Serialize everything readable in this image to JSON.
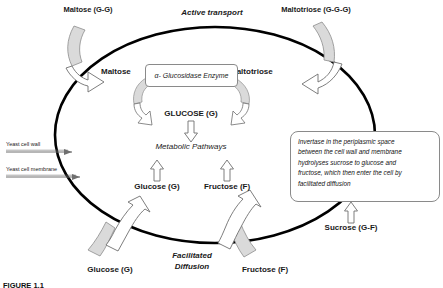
{
  "figure": {
    "caption": "FIGURE 1.1",
    "cell_outline_name": "yeast-cell-boundary"
  },
  "top_labels": {
    "maltose_extracellular": "Maltose (G-G)",
    "active_transport": "Active transport",
    "maltotriose_extracellular": "Maltotriose (G-G-G)"
  },
  "inside_labels": {
    "maltose": "Maltose",
    "maltotriose": "Maltotriose",
    "enzyme": "α- Glucosidase Enzyme",
    "glucose_pool": "GLUCOSE (G)",
    "metabolic_pathways": "Metabolic Pathways",
    "glucose": "Glucose (G)",
    "fructose": "Fructose (F)"
  },
  "left_labels": {
    "cell_wall": "Yeast cell wall",
    "cell_membrane": "Yeast cell membrane"
  },
  "bottom_labels": {
    "glucose_extracellular": "Glucose (G)",
    "facilitated_line1": "Facilitated",
    "facilitated_line2": "Diffusion",
    "fructose_extracellular": "Fructose (F)"
  },
  "right_panel": {
    "text": "Invertase in the periplasmic space between the cell wall and membrane hydrolyses  sucrose to glucose and fructose, which then enter the cell by facilitated diffusion",
    "lines": [
      "Invertase in the periplasmic space",
      "between the cell wall and membrane",
      "hydrolyses  sucrose to glucose and",
      "fructose, which then enter the cell by",
      "facilitated diffusion"
    ],
    "substrate": "Sucrose (G-F)"
  },
  "colors": {
    "outline": "#000000",
    "arrow_stroke": "#6f6f6f",
    "arrow_fill_gray": "#d9d9d9",
    "arrow_fill_white": "#ffffff",
    "box_border": "#8a8a8a",
    "text": "#111111"
  }
}
